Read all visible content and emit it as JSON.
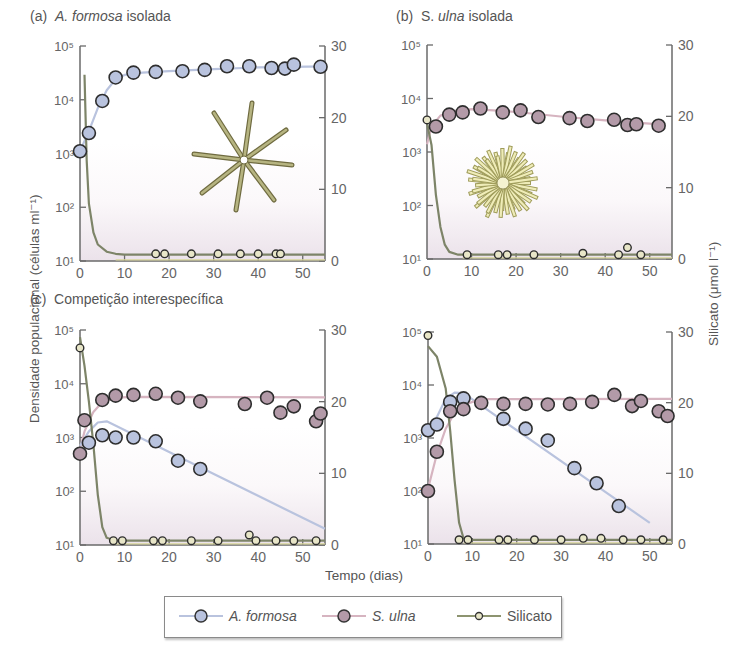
{
  "figure": {
    "panels": [
      {
        "id": "a",
        "prefix": "(a)",
        "title_italic": "A. formosa",
        "title_rest": " isolada"
      },
      {
        "id": "b",
        "prefix": "(b)",
        "title_plain": "S. ",
        "title_italic": "ulna",
        "title_rest": " isolada"
      },
      {
        "id": "c",
        "prefix": "(c)",
        "title_rest": "Competição interespecífica"
      },
      {
        "id": "d",
        "prefix": "",
        "title_rest": ""
      }
    ],
    "y_left_label": "Densidade populacional (células ml⁻¹)",
    "y_right_label": "Silicato (μmol l⁻¹)",
    "x_label": "Tempo (dias)",
    "legend": [
      {
        "label": "A. formosa",
        "italic": true,
        "color": "#b9c3de"
      },
      {
        "label": "S. ulna",
        "italic": true,
        "color": "#b39aa8"
      },
      {
        "label": "Silicato",
        "italic": false,
        "color": "#8d9470"
      }
    ]
  },
  "chart_data": [
    {
      "type": "scatter",
      "title": "(a) A. formosa isolada",
      "xlabel": "Tempo (dias)",
      "ylabel": "Densidade populacional (células ml⁻¹)",
      "y2label": "Silicato (μmol l⁻¹)",
      "xlim": [
        0,
        55
      ],
      "ylim": [
        10,
        100000
      ],
      "yscale": "log",
      "y2lim": [
        0,
        30
      ],
      "xticks": [
        0,
        10,
        20,
        30,
        40,
        50
      ],
      "yticks": [
        "10¹",
        "10²",
        "10³",
        "10⁴",
        "10⁵"
      ],
      "y2ticks": [
        0,
        10,
        20,
        30
      ],
      "series": [
        {
          "name": "A. formosa",
          "axis": "left",
          "x": [
            0,
            2,
            5,
            8,
            12,
            17,
            23,
            28,
            33,
            38,
            43,
            46,
            48,
            54
          ],
          "y": [
            1100,
            2400,
            9500,
            26000,
            32000,
            33000,
            34000,
            36000,
            42000,
            42000,
            39000,
            38000,
            45000,
            41000
          ],
          "curve": [
            [
              0,
              1100
            ],
            [
              2,
              2600
            ],
            [
              4,
              7000
            ],
            [
              6,
              15000
            ],
            [
              8,
              24000
            ],
            [
              10,
              29000
            ],
            [
              14,
              32000
            ],
            [
              20,
              34000
            ],
            [
              30,
              37000
            ],
            [
              40,
              40000
            ],
            [
              55,
              42000
            ]
          ]
        },
        {
          "name": "Silicato",
          "axis": "right",
          "x": [
            17,
            19,
            25,
            31,
            36,
            40,
            44,
            45
          ],
          "y": [
            1,
            1,
            1,
            1,
            1,
            1,
            1,
            1
          ],
          "curve": [
            [
              1,
              26
            ],
            [
              1.5,
              14
            ],
            [
              2,
              8
            ],
            [
              3,
              4
            ],
            [
              4,
              2.3
            ],
            [
              6,
              1.3
            ],
            [
              8,
              1
            ],
            [
              10,
              0.9
            ],
            [
              55,
              0.9
            ]
          ]
        }
      ]
    },
    {
      "type": "scatter",
      "title": "(b) S. ulna isolada",
      "xlim": [
        0,
        55
      ],
      "ylim": [
        10,
        100000
      ],
      "yscale": "log",
      "y2lim": [
        0,
        30
      ],
      "xticks": [
        0,
        10,
        20,
        30,
        40,
        50
      ],
      "yticks": [
        "10¹",
        "10²",
        "10³",
        "10⁴",
        "10⁵"
      ],
      "y2ticks": [
        0,
        10,
        20,
        30
      ],
      "series": [
        {
          "name": "S. ulna",
          "axis": "left",
          "x": [
            2,
            5,
            8,
            12,
            17,
            21,
            25,
            32,
            36,
            42,
            45,
            47,
            52
          ],
          "y": [
            3000,
            5000,
            5500,
            6500,
            5500,
            6000,
            4500,
            4300,
            3800,
            4000,
            3200,
            3300,
            3100
          ],
          "curve": [
            [
              0,
              1400
            ],
            [
              1,
              3000
            ],
            [
              3,
              4800
            ],
            [
              6,
              5800
            ],
            [
              10,
              6300
            ],
            [
              15,
              6000
            ],
            [
              20,
              5600
            ],
            [
              30,
              4600
            ],
            [
              40,
              3900
            ],
            [
              50,
              3400
            ],
            [
              53,
              3200
            ]
          ]
        },
        {
          "name": "Silicato",
          "axis": "right",
          "x": [
            0,
            9,
            16,
            18,
            24,
            35,
            43,
            45,
            48
          ],
          "y": [
            19.5,
            0.6,
            0.6,
            0.6,
            0.6,
            0.8,
            0.6,
            1.6,
            0.6
          ],
          "curve": [
            [
              0,
              19
            ],
            [
              1,
              16
            ],
            [
              2,
              9
            ],
            [
              3,
              4.5
            ],
            [
              4,
              2
            ],
            [
              5,
              1
            ],
            [
              7,
              0.6
            ],
            [
              55,
              0.6
            ]
          ]
        }
      ]
    },
    {
      "type": "scatter",
      "title": "(c) Competição interespecífica",
      "xlim": [
        0,
        55
      ],
      "ylim": [
        10,
        100000
      ],
      "yscale": "log",
      "y2lim": [
        0,
        30
      ],
      "xticks": [
        0,
        10,
        20,
        30,
        40,
        50
      ],
      "yticks": [
        "10¹",
        "10²",
        "10³",
        "10⁴",
        "10⁵"
      ],
      "y2ticks": [
        0,
        10,
        20,
        30
      ],
      "series": [
        {
          "name": "S. ulna",
          "axis": "left",
          "x": [
            0,
            1,
            5,
            8,
            12,
            17,
            22,
            27,
            37,
            42,
            45,
            48,
            53,
            54
          ],
          "y": [
            500,
            2100,
            5000,
            6000,
            6200,
            6500,
            5500,
            4700,
            4200,
            5500,
            2900,
            3800,
            2000,
            2800
          ],
          "curve": [
            [
              0,
              600
            ],
            [
              1,
              1300
            ],
            [
              3,
              3000
            ],
            [
              5,
              4600
            ],
            [
              8,
              5500
            ],
            [
              12,
              5700
            ],
            [
              55,
              5600
            ]
          ]
        },
        {
          "name": "A. formosa",
          "axis": "left",
          "x": [
            2,
            5,
            8,
            12,
            17,
            22,
            27
          ],
          "y": [
            800,
            1100,
            1000,
            1000,
            850,
            370,
            260
          ],
          "curve": [
            [
              0,
              700
            ],
            [
              2,
              1300
            ],
            [
              4,
              1900
            ],
            [
              6,
              2000
            ],
            [
              55,
              20
            ]
          ]
        },
        {
          "name": "Silicato",
          "axis": "right",
          "x": [
            0,
            7.5,
            9.5,
            16.5,
            18.5,
            25,
            31,
            38,
            39.5,
            44,
            48,
            53
          ],
          "y": [
            27.5,
            0.6,
            0.6,
            0.6,
            0.6,
            0.6,
            0.6,
            1.4,
            0.6,
            0.6,
            0.6,
            0.6
          ],
          "curve": [
            [
              0,
              29
            ],
            [
              1,
              25
            ],
            [
              2,
              20
            ],
            [
              3,
              14
            ],
            [
              4,
              7
            ],
            [
              5,
              2.5
            ],
            [
              6,
              1
            ],
            [
              8,
              0.6
            ],
            [
              55,
              0.6
            ]
          ]
        }
      ]
    },
    {
      "type": "scatter",
      "title": "(d)",
      "xlim": [
        0,
        55
      ],
      "ylim": [
        10,
        100000
      ],
      "yscale": "log",
      "y2lim": [
        0,
        30
      ],
      "xticks": [
        0,
        10,
        20,
        30,
        40,
        50
      ],
      "yticks": [
        "10¹",
        "10²",
        "10³",
        "10⁴",
        "10⁵"
      ],
      "y2ticks": [
        0,
        10,
        20,
        30
      ],
      "series": [
        {
          "name": "A. formosa",
          "axis": "left",
          "x": [
            0,
            2,
            5,
            8,
            17,
            22,
            27,
            33,
            38,
            43
          ],
          "y": [
            1400,
            1800,
            4800,
            5600,
            2300,
            1500,
            900,
            270,
            140,
            52
          ],
          "curve": [
            [
              0,
              1300
            ],
            [
              2,
              2500
            ],
            [
              4,
              5500
            ],
            [
              6,
              7200
            ],
            [
              8,
              7000
            ],
            [
              50,
              25
            ]
          ]
        },
        {
          "name": "S. ulna",
          "axis": "left",
          "x": [
            0,
            2,
            5,
            8,
            12,
            17,
            22,
            27,
            32,
            37,
            42,
            46,
            48,
            52,
            54
          ],
          "y": [
            100,
            550,
            3200,
            3500,
            4600,
            4400,
            4400,
            4300,
            4400,
            4800,
            6500,
            4000,
            5000,
            3200,
            2600
          ],
          "curve": [
            [
              0,
              110
            ],
            [
              2,
              500
            ],
            [
              4,
              1500
            ],
            [
              6,
              3000
            ],
            [
              9,
              4500
            ],
            [
              12,
              5400
            ],
            [
              55,
              5500
            ]
          ]
        },
        {
          "name": "Silicato",
          "axis": "right",
          "x": [
            0,
            7,
            9,
            16,
            18,
            24,
            30,
            35,
            39,
            44,
            48,
            53
          ],
          "y": [
            29.5,
            0.6,
            0.6,
            0.6,
            0.6,
            0.6,
            0.6,
            0.8,
            0.8,
            0.6,
            0.6,
            0.6
          ],
          "curve": [
            [
              0,
              28
            ],
            [
              2,
              26.5
            ],
            [
              4,
              22
            ],
            [
              5,
              16
            ],
            [
              6,
              9
            ],
            [
              7,
              3
            ],
            [
              8,
              0.8
            ],
            [
              9,
              0.6
            ],
            [
              55,
              0.6
            ]
          ]
        }
      ]
    }
  ],
  "axes_px": [
    {
      "x0": 80,
      "x1": 325,
      "ytop": 46,
      "ybot": 261
    },
    {
      "x0": 427,
      "x1": 672,
      "ytop": 45,
      "ybot": 259
    },
    {
      "x0": 80,
      "x1": 325,
      "ytop": 330,
      "ybot": 545
    },
    {
      "x0": 428,
      "x1": 672,
      "ytop": 332,
      "ybot": 544
    }
  ]
}
